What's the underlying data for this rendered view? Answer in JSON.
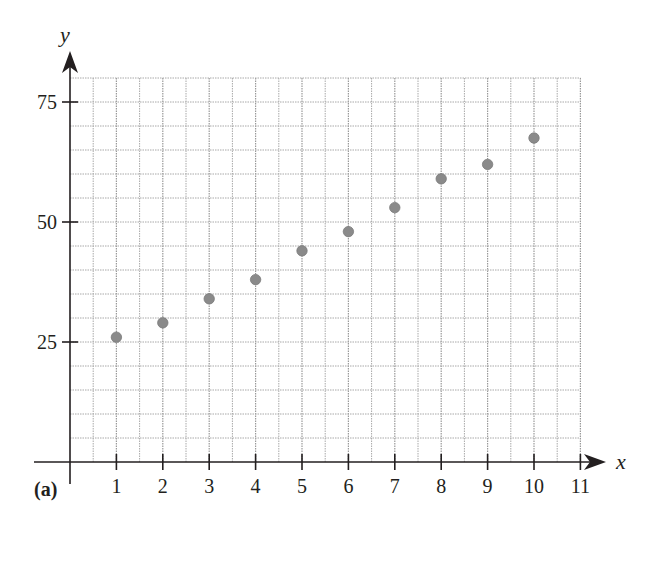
{
  "panel_label": "(a)",
  "chart_data": {
    "type": "scatter",
    "title": "",
    "xlabel": "x",
    "ylabel": "y",
    "x": [
      1,
      2,
      3,
      4,
      5,
      6,
      7,
      8,
      9,
      10
    ],
    "y": [
      26,
      29,
      34,
      38,
      44,
      48,
      53,
      59,
      62,
      67.5
    ],
    "series": [
      {
        "name": "data",
        "x": [
          1,
          2,
          3,
          4,
          5,
          6,
          7,
          8,
          9,
          10
        ],
        "values": [
          26,
          29,
          34,
          38,
          44,
          48,
          53,
          59,
          62,
          67.5
        ]
      }
    ],
    "xlim": [
      0,
      11
    ],
    "ylim": [
      0,
      80
    ],
    "x_ticks": [
      1,
      2,
      3,
      4,
      5,
      6,
      7,
      8,
      9,
      10,
      11
    ],
    "y_ticks": [
      25,
      50,
      75
    ],
    "grid": {
      "on": true,
      "x_step": 0.5,
      "y_step": 5,
      "style": "dotted"
    },
    "legend": null,
    "colors": {
      "point": "#8a8a8a",
      "grid": "#a8a8a8",
      "axis": "#231f20"
    }
  }
}
